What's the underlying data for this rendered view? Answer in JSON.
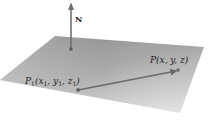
{
  "diagram": {
    "type": "plane-with-normal-vector",
    "plane": {
      "corners": [
        [
          55,
          36
        ],
        [
          204,
          47
        ],
        [
          180,
          113
        ],
        [
          0,
          80
        ]
      ],
      "color_dark": "#7a7a7a",
      "color_light": "#e6e6e6"
    },
    "normal": {
      "label": "N",
      "base": [
        71,
        49
      ],
      "tip": [
        71,
        2
      ],
      "color": "#6f6f6f"
    },
    "points": [
      {
        "name": "P1",
        "label_main": "P",
        "label_sub": "1",
        "label_coords": "(x",
        "label_text": "P1(x1, y1, z1)",
        "position": [
          78,
          90
        ],
        "label_position": [
          25,
          81
        ]
      },
      {
        "name": "P",
        "label_text": "P(x, y, z)",
        "position": [
          178,
          70
        ],
        "label_position": [
          150,
          58
        ]
      }
    ],
    "vector": {
      "from": "P1",
      "to": "P",
      "color": "#6a6a6a"
    }
  }
}
